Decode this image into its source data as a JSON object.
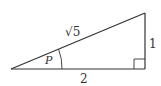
{
  "diagram": {
    "type": "right-triangle",
    "hypotenuse_label": "√5",
    "opposite_label": "1",
    "adjacent_label": "2",
    "angle_label": "P",
    "right_angle_marker": true,
    "stroke_color": "#333333"
  }
}
